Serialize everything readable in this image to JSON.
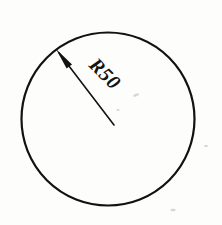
{
  "drawing": {
    "title": "Circle with radius dimension",
    "background_color": "#fdfdfb",
    "ink_color": "#121212",
    "circle": {
      "center_x": 108,
      "center_y": 119,
      "radius_px": 86.5,
      "stroke_width": 2.2
    },
    "leader": {
      "arrow_tip_x": 56,
      "arrow_tip_y": 49,
      "tail_x": 114,
      "tail_y": 125,
      "stroke_width": 1.6,
      "arrow_name": "arrowhead"
    },
    "dimension_label": {
      "text": "R50",
      "value": 50,
      "prefix": "R",
      "rotation_deg": 45,
      "x": 88,
      "y": 66
    }
  }
}
